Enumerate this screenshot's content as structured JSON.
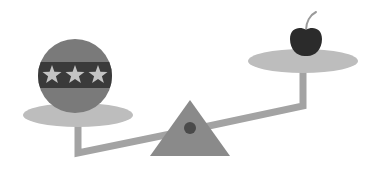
{
  "illustration": {
    "subject": "balance scale / seesaw comparing a star-banded ball with a cherry",
    "left_object": "star-band ball",
    "right_object": "cherry",
    "stars_count": 3
  },
  "colors": {
    "background": "#ffffff",
    "plate": "#bdbdbd",
    "beam": "#a3a3a3",
    "fulcrum": "#8a8a8a",
    "pivot": "#4a4a4a",
    "ball_body": "#7a7a7a",
    "ball_band": "#3a3a3a",
    "star": "#c4c4c4",
    "cherry": "#2b2b2b",
    "stem": "#9a9a9a"
  }
}
